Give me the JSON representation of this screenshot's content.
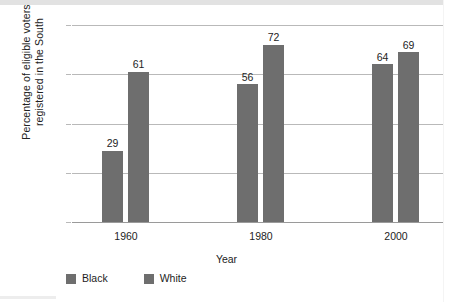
{
  "chart_data": {
    "type": "bar",
    "title": "",
    "subtitle": "",
    "xlabel": "Year",
    "ylabel_line1": "Percentage of eligible voters",
    "ylabel_line2": "registered in the South",
    "ylabel": "Percentage of eligible voters registered in the South",
    "categories": [
      "1960",
      "1980",
      "2000"
    ],
    "series": [
      {
        "name": "Black",
        "values": [
          29,
          56,
          72
        ],
        "color": "#6e6e6e"
      },
      {
        "name": "White",
        "values": [
          61,
          72,
          69
        ],
        "color": "#6e6e6e"
      }
    ],
    "bars": [
      {
        "group": "1960",
        "series": "Black",
        "value": 29,
        "label": "29"
      },
      {
        "group": "1960",
        "series": "White",
        "value": 61,
        "label": "61"
      },
      {
        "group": "1980",
        "series": "Black",
        "value": 56,
        "label": "56"
      },
      {
        "group": "1980",
        "series": "White",
        "value": 72,
        "label": "72"
      },
      {
        "group": "2000",
        "series": "Black",
        "value": 64,
        "label": "64"
      },
      {
        "group": "2000",
        "series": "White",
        "value": 69,
        "label": "69"
      }
    ],
    "ylim": [
      0,
      80
    ],
    "yticks": [
      "0",
      "20",
      "40",
      "60",
      "80"
    ],
    "ytick_values": [
      0,
      20,
      40,
      60,
      80
    ],
    "grid": true,
    "grid_axis": "y",
    "legend_position": "bottom-left",
    "legend": [
      "Black",
      "White"
    ],
    "bar_color": "#6e6e6e",
    "gridline_color": "#b9b9b9",
    "axis_color": "#9a9a9a",
    "text_color": "#1d1d1d",
    "background": "#ffffff"
  }
}
